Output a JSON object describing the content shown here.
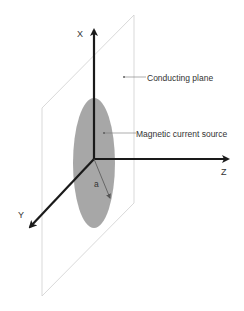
{
  "diagram": {
    "axes": {
      "x_label": "X",
      "y_label": "Y",
      "z_label": "Z"
    },
    "annotations": {
      "plane_label": "Conducting plane",
      "source_label": "Magnetic current source",
      "radius_label": "a"
    },
    "colors": {
      "axis": "#1a1a1a",
      "plane_edge": "#c8c8c8",
      "source_fill": "#9a9a9a",
      "text": "#333333",
      "leader": "#777777"
    }
  }
}
